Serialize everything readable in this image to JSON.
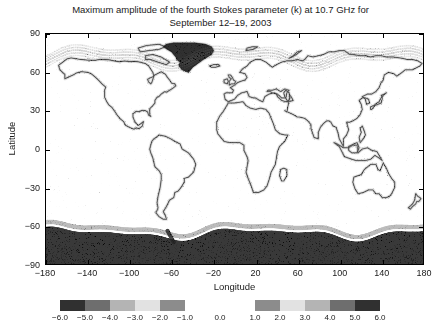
{
  "figure": {
    "title_lines": [
      "Maximum amplitude of the fourth Stokes parameter (k) at 10.7 GHz for",
      "September 12–19, 2003"
    ]
  },
  "chart_data": {
    "type": "heatmap",
    "title": "Maximum amplitude of the fourth Stokes parameter (k) at 10.7 GHz for September 12–19, 2003",
    "subtitle": "September 12–19, 2003",
    "xlabel": "Longitude",
    "ylabel": "Latitude",
    "xlim": [
      -180,
      180
    ],
    "ylim": [
      -90,
      90
    ],
    "xticks": [
      -180,
      -140,
      -100,
      -60,
      -20,
      20,
      60,
      100,
      140,
      180
    ],
    "xtick_labels": [
      "−180",
      "−140",
      "−100",
      "−60",
      "−20",
      "20",
      "60",
      "100",
      "140",
      "180"
    ],
    "yticks": [
      -90,
      -60,
      -30,
      0,
      30,
      60,
      90
    ],
    "ytick_labels": [
      "−90",
      "−60",
      "−30",
      "0",
      "30",
      "60",
      "90"
    ],
    "grid": false,
    "legend_position": "bottom",
    "colormap": "grayscale-diverging-split",
    "regions_of_interest": [
      {
        "name": "Antarctica",
        "latitude_band": [
          -90,
          -60
        ],
        "intensity": "high"
      },
      {
        "name": "Greenland",
        "latitude_band": [
          60,
          84
        ],
        "longitude_band": [
          -70,
          -20
        ],
        "intensity": "high"
      },
      {
        "name": "Global coastlines",
        "intensity": "moderate"
      },
      {
        "name": "Open ocean",
        "intensity": "low"
      }
    ],
    "colorbar": {
      "has_zero_gap": true,
      "gap_label": "0.0",
      "segments": [
        {
          "name": "negative",
          "range": [
            -6.0,
            -1.0
          ],
          "tick_values": [
            -6.0,
            -5.0,
            -4.0,
            -3.0,
            -2.0,
            -1.0
          ],
          "tick_labels": [
            "−6.0",
            "−5.0",
            "−4.0",
            "−3.0",
            "−2.0",
            "−1.0"
          ],
          "cell_colors": [
            "#303030",
            "#6e6e6e",
            "#b4b4b4",
            "#e2e2e2",
            "#8c8c8c"
          ]
        },
        {
          "name": "positive",
          "range": [
            1.0,
            6.0
          ],
          "tick_values": [
            1.0,
            2.0,
            3.0,
            4.0,
            5.0,
            6.0
          ],
          "tick_labels": [
            "1.0",
            "2.0",
            "3.0",
            "4.0",
            "5.0",
            "6.0"
          ],
          "cell_colors": [
            "#8c8c8c",
            "#e2e2e2",
            "#b4b4b4",
            "#6e6e6e",
            "#303030"
          ]
        }
      ]
    }
  },
  "colors": {
    "axis": "#000000",
    "text": "#1a1a1a",
    "background": "#ffffff"
  }
}
